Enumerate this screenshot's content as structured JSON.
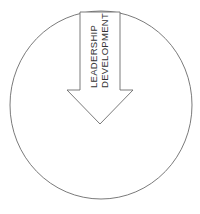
{
  "diagram": {
    "circle": {
      "stroke": "#6b6b6b",
      "fill": "#ffffff"
    },
    "arrow": {
      "direction": "down",
      "stroke": "#6b6b6b",
      "fill": "#ffffff",
      "label_line1": "LEADERSHIP",
      "label_line2": "DEVELOPMENT"
    }
  }
}
